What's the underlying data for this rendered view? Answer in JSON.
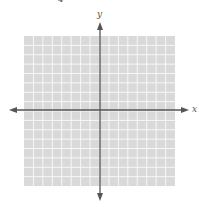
{
  "plane": {
    "x_label": "x",
    "y_label": "y",
    "grid_cells_x": 16,
    "grid_cells_y": 16,
    "grid_background": "#d9d9d9",
    "grid_line_color": "#f7f7f7",
    "axis_color": "#555555",
    "grid_bounds": {
      "left": 24,
      "top": 36,
      "right": 175,
      "bottom": 186
    },
    "origin_px": {
      "x": 100,
      "y": 110
    },
    "x_axis_extent_px": {
      "left": 9,
      "right": 189
    },
    "y_axis_extent_px": {
      "top": 22,
      "bottom": 201
    }
  },
  "top_fragment": "4"
}
